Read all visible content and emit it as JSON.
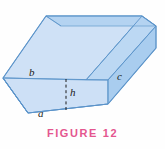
{
  "figure": {
    "caption": "FIGURE 12",
    "caption_color": "#e4568f",
    "background_color": "#fefefe",
    "shape_description": "trapezoidal-trough-prism",
    "labels": {
      "b": "b",
      "a": "a",
      "c": "c",
      "h": "h"
    },
    "colors": {
      "inner_back_face": "#cfe1f6",
      "inner_bottom_face": "#c2dbf4",
      "front_face": "#cde0f6",
      "left_end_face": "#bcd8f3",
      "right_end_face": "#a9cdef",
      "top_rim_face": "#a9cdef",
      "edge_stroke": "#5b93c9",
      "label_text": "#1a1a1a"
    }
  }
}
